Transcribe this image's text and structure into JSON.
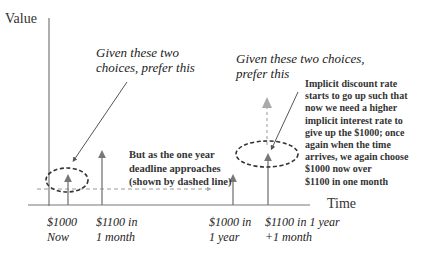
{
  "axes": {
    "y_label": "Value",
    "x_label": "Time"
  },
  "annotations": {
    "left_prefer": [
      "Given these two",
      "choices, prefer this"
    ],
    "right_prefer": [
      "Given these two choices,",
      "prefer this"
    ],
    "middle_note": [
      "But as the one year",
      "deadline approaches",
      "(shown by dashed line)"
    ],
    "right_note": [
      "Implicit discount rate",
      "starts to go up such that",
      "now we need a higher",
      "implicit interest rate to",
      "give up the $1000; once",
      "again when the time",
      "arrives, we again choose",
      "$1000 now over",
      "$1100 in one month"
    ]
  },
  "ticks": [
    {
      "line1": "$1000",
      "line2": "Now"
    },
    {
      "line1": "$1100 in",
      "line2": "1 month"
    },
    {
      "line1": "$1000 in",
      "line2": "1 year"
    },
    {
      "line1": "$1100 in 1 year",
      "line2": "+1 month"
    }
  ],
  "colors": {
    "axis": "#777777",
    "arrow": "#777777",
    "dashed": "#999999",
    "ellipse": "#333333"
  }
}
